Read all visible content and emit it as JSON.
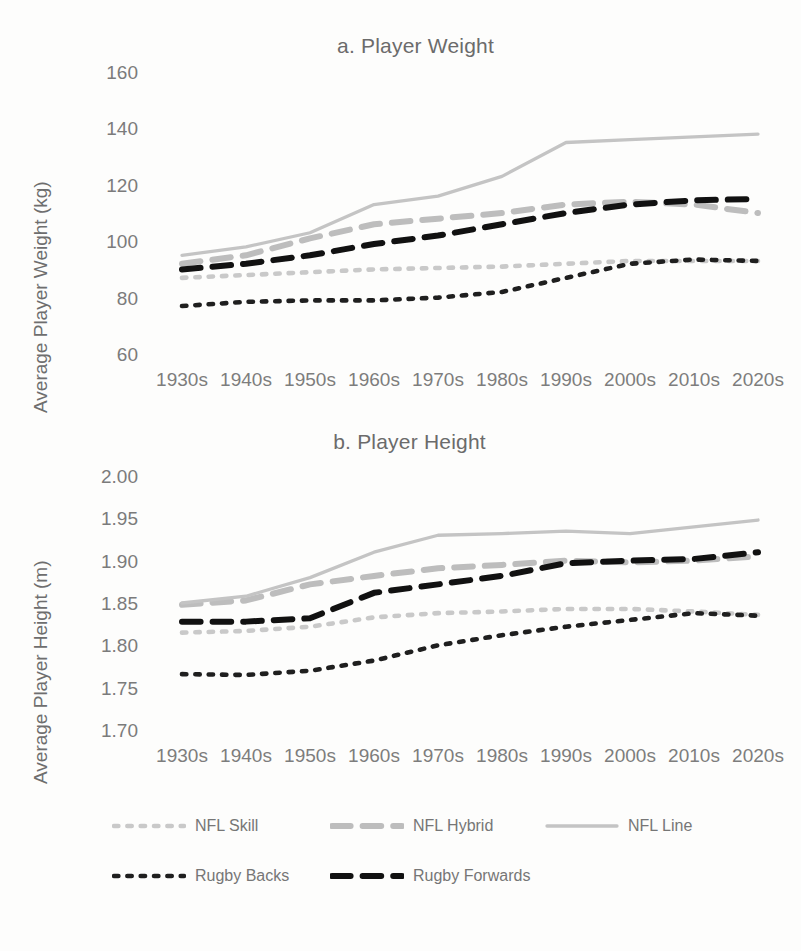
{
  "figure": {
    "background": "#fdfdfc"
  },
  "panels": [
    {
      "id": "a",
      "title": "a. Player Weight",
      "ylabel": "Average Player Weight (kg)"
    },
    {
      "id": "b",
      "title": "b. Player Height",
      "ylabel": "Average Player Height (m)"
    }
  ],
  "legend": {
    "position": "bottom",
    "rows": [
      [
        {
          "label": "NFL Skill",
          "color": "#c9c9c9",
          "style": "dotted"
        },
        {
          "label": "NFL Hybrid",
          "color": "#bdbdbd",
          "style": "dashed"
        },
        {
          "label": "NFL Line",
          "color": "#c4c4c4",
          "style": "solid"
        }
      ],
      [
        {
          "label": "Rugby Backs",
          "color": "#1f1f1f",
          "style": "dotted"
        },
        {
          "label": "Rugby Forwards",
          "color": "#111111",
          "style": "dashed"
        }
      ]
    ]
  },
  "chart_data": [
    {
      "type": "line",
      "title": "a. Player Weight",
      "xlabel": "",
      "ylabel": "Average Player Weight (kg)",
      "categories": [
        "1930s",
        "1940s",
        "1950s",
        "1960s",
        "1970s",
        "1980s",
        "1990s",
        "2000s",
        "2010s",
        "2020s"
      ],
      "ylim": [
        60,
        160
      ],
      "yticks": [
        60,
        80,
        100,
        120,
        140,
        160
      ],
      "yticklabels": [
        "60",
        "80",
        "100",
        "120",
        "140",
        "160"
      ],
      "grid": false,
      "legend_position": "bottom",
      "series": [
        {
          "name": "NFL Skill",
          "color": "#c9c9c9",
          "style": "dotted",
          "values": [
            87,
            88,
            89,
            90,
            90.5,
            91,
            92,
            93,
            93,
            93
          ]
        },
        {
          "name": "NFL Hybrid",
          "color": "#bdbdbd",
          "style": "dashed",
          "values": [
            92,
            95,
            101,
            106,
            108,
            110,
            113,
            114,
            113,
            110
          ]
        },
        {
          "name": "NFL Line",
          "color": "#c4c4c4",
          "style": "solid",
          "values": [
            95,
            98,
            103,
            113,
            116,
            123,
            135,
            136,
            137,
            138
          ]
        },
        {
          "name": "Rugby Backs",
          "color": "#1f1f1f",
          "style": "dotted",
          "values": [
            77,
            78.5,
            79,
            79,
            80,
            82,
            87,
            92,
            93.5,
            93
          ]
        },
        {
          "name": "Rugby Forwards",
          "color": "#111111",
          "style": "dashed",
          "values": [
            90,
            92,
            95,
            99,
            102,
            106,
            110,
            113,
            114.5,
            115
          ]
        }
      ]
    },
    {
      "type": "line",
      "title": "b. Player Height",
      "xlabel": "",
      "ylabel": "Average Player Height (m)",
      "categories": [
        "1930s",
        "1940s",
        "1950s",
        "1960s",
        "1970s",
        "1980s",
        "1990s",
        "2000s",
        "2010s",
        "2020s"
      ],
      "ylim": [
        1.7,
        2.0
      ],
      "yticks": [
        1.7,
        1.75,
        1.8,
        1.85,
        1.9,
        1.95,
        2.0
      ],
      "yticklabels": [
        "1.70",
        "1.75",
        "1.80",
        "1.85",
        "1.90",
        "1.95",
        "2.00"
      ],
      "grid": false,
      "legend_position": "bottom",
      "series": [
        {
          "name": "NFL Skill",
          "color": "#c9c9c9",
          "style": "dotted",
          "values": [
            1.815,
            1.817,
            1.822,
            1.833,
            1.838,
            1.84,
            1.843,
            1.843,
            1.84,
            1.836
          ]
        },
        {
          "name": "NFL Hybrid",
          "color": "#bdbdbd",
          "style": "dashed",
          "values": [
            1.848,
            1.853,
            1.872,
            1.882,
            1.891,
            1.895,
            1.9,
            1.898,
            1.9,
            1.905
          ]
        },
        {
          "name": "NFL Line",
          "color": "#c4c4c4",
          "style": "solid",
          "values": [
            1.85,
            1.858,
            1.88,
            1.91,
            1.93,
            1.932,
            1.935,
            1.932,
            1.94,
            1.948
          ]
        },
        {
          "name": "Rugby Backs",
          "color": "#1f1f1f",
          "style": "dotted",
          "values": [
            1.766,
            1.765,
            1.77,
            1.782,
            1.8,
            1.812,
            1.822,
            1.83,
            1.838,
            1.835
          ]
        },
        {
          "name": "Rugby Forwards",
          "color": "#111111",
          "style": "dashed",
          "values": [
            1.828,
            1.828,
            1.832,
            1.862,
            1.872,
            1.882,
            1.897,
            1.9,
            1.902,
            1.91
          ]
        }
      ]
    }
  ]
}
